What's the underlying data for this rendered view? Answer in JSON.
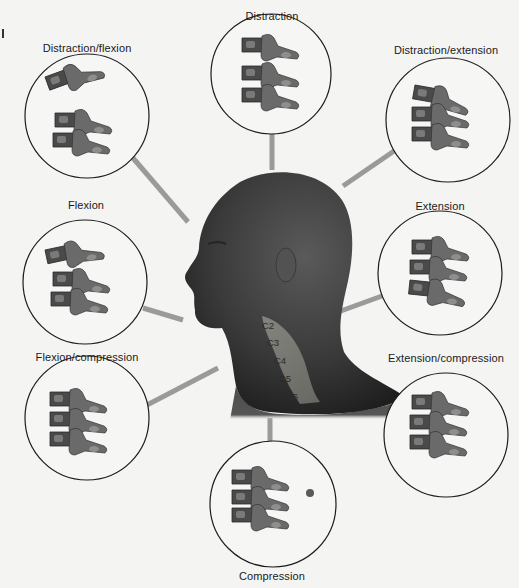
{
  "diagram": {
    "center": {
      "subject": "head-profile-left-facing",
      "cervical_labels": [
        "C2",
        "C3",
        "C4",
        "C5",
        "C6",
        "C7"
      ]
    },
    "mechanisms": [
      {
        "id": "distraction-flexion",
        "label": "Distraction/flexion"
      },
      {
        "id": "distraction",
        "label": "Distraction"
      },
      {
        "id": "distraction-extension",
        "label": "Distraction/extension"
      },
      {
        "id": "flexion",
        "label": "Flexion"
      },
      {
        "id": "extension",
        "label": "Extension"
      },
      {
        "id": "flexion-compression",
        "label": "Flexion/compression"
      },
      {
        "id": "extension-compression",
        "label": "Extension/compression"
      },
      {
        "id": "compression",
        "label": "Compression"
      }
    ],
    "colors": {
      "background": "#f4f4f3",
      "connector": "#9a9a9a",
      "circle_stroke": "#1c1c1c",
      "bone_dark": "#3c3c3c",
      "bone_mid": "#6e6e6e",
      "bone_light": "#9c9c9c",
      "skin": "#4a4a4a"
    }
  }
}
